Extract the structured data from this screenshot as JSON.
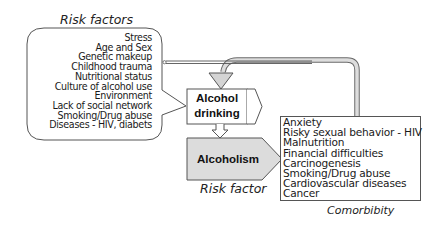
{
  "risk_factors": {
    "title": "Risk factors",
    "items": [
      "Stress",
      "Age and Sex",
      "Genetic makeup",
      "Childhood trauma",
      "Nutritional status",
      "Culture of alcohol use",
      "Environment",
      "Lack of social network",
      "Smoking/Drug abuse",
      "Diseases - HIV, diabets"
    ]
  },
  "alcohol_drinking": {
    "line1": "Alcohol",
    "line2": "drinking"
  },
  "alcoholism": {
    "label": "Alcoholism",
    "caption": "Risk factor"
  },
  "comorbidity": {
    "title": "Comorbibity",
    "items": [
      "Anxiety",
      "Risky sexual behavior - HIV",
      "Malnutrition",
      "Financial difficulties",
      "Carcinogenesis",
      "Smoking/Drug abuse",
      "Cardiovascular diseases",
      "Cancer"
    ]
  },
  "colors": {
    "stroke": "#555555",
    "arrow_fill": "#d4d4d4",
    "alcoholism_fill": "#dcdcdc",
    "background": "#ffffff"
  }
}
